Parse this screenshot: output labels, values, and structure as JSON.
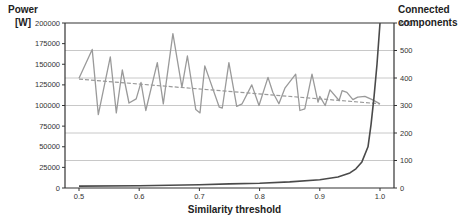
{
  "chart_data": {
    "type": "line",
    "title": "",
    "xlabel": "Similarity threshold",
    "ylabel": "Power\n[W]",
    "ylabel_left_line1": "Power",
    "ylabel_left_line2": "[W]",
    "ylabel_right_line1": "Connected",
    "ylabel_right_line2": "components",
    "xlim": [
      0.5,
      1.0
    ],
    "ylim_left": [
      0,
      200000
    ],
    "ylim_right": [
      0,
      600
    ],
    "x_ticks": [
      "0.5",
      "0.6",
      "0.7",
      "0.8",
      "0.9",
      "1.0"
    ],
    "y_ticks_left": [
      "0",
      "25000",
      "50000",
      "75000",
      "100000",
      "125000",
      "150000",
      "175000",
      "200000"
    ],
    "y_ticks_right": [
      "0",
      "100",
      "200",
      "300",
      "400",
      "500",
      "600"
    ],
    "grid": "horizontal, aligned to right axis",
    "legend": "none",
    "series": [
      {
        "name": "Power [W]",
        "axis": "left",
        "style": "solid gray",
        "color": "#9a9a9a",
        "x": [
          0.5,
          0.522,
          0.532,
          0.552,
          0.562,
          0.572,
          0.583,
          0.595,
          0.603,
          0.611,
          0.63,
          0.64,
          0.656,
          0.671,
          0.68,
          0.694,
          0.701,
          0.709,
          0.733,
          0.738,
          0.749,
          0.762,
          0.771,
          0.787,
          0.799,
          0.814,
          0.822,
          0.832,
          0.842,
          0.86,
          0.867,
          0.875,
          0.887,
          0.897,
          0.9,
          0.909,
          0.917,
          0.932,
          0.937,
          0.945,
          0.955,
          0.963,
          0.975,
          0.987,
          1.0
        ],
        "values": [
          133000,
          168000,
          89000,
          159000,
          91000,
          143000,
          103000,
          108000,
          128000,
          94000,
          152000,
          102000,
          187000,
          122000,
          160000,
          95000,
          91000,
          148000,
          98000,
          97000,
          152000,
          99000,
          102000,
          125000,
          100000,
          134000,
          116000,
          102000,
          121000,
          138000,
          94000,
          96000,
          138000,
          104000,
          111000,
          100000,
          119000,
          106000,
          118000,
          116000,
          107000,
          110000,
          111000,
          107000,
          102000
        ]
      },
      {
        "name": "Power trend",
        "axis": "left",
        "style": "dashed gray",
        "color": "#9a9a9a",
        "x": [
          0.5,
          1.0
        ],
        "values": [
          132000,
          102000
        ]
      },
      {
        "name": "Connected components",
        "axis": "right",
        "style": "solid dark",
        "color": "#4a4a4a",
        "x": [
          0.5,
          0.6,
          0.7,
          0.75,
          0.8,
          0.85,
          0.9,
          0.93,
          0.95,
          0.96,
          0.97,
          0.98,
          0.985,
          0.99,
          0.995,
          1.0
        ],
        "values": [
          7,
          8,
          12,
          15,
          17,
          22,
          30,
          40,
          55,
          70,
          95,
          150,
          230,
          330,
          450,
          600
        ]
      }
    ]
  }
}
